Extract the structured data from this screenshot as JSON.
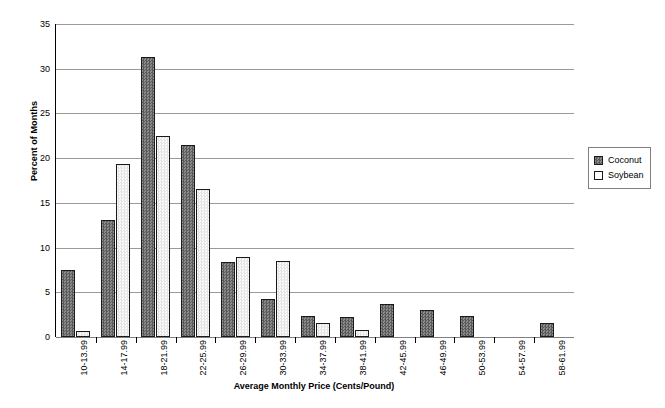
{
  "chart_data": {
    "type": "bar",
    "title": "",
    "xlabel": "Average Monthly Price (Cents/Pound)",
    "ylabel": "Percent of Months",
    "ylim": [
      0,
      35
    ],
    "yticks": [
      0,
      5,
      10,
      15,
      20,
      25,
      30,
      35
    ],
    "grid": true,
    "legend_position": "right",
    "categories": [
      "10-13.99",
      "14-17.99",
      "18-21.99",
      "22-25.99",
      "26-29.99",
      "30-33.99",
      "34-37.99",
      "38-41.99",
      "42-45.99",
      "46-49.99",
      "50-53.99",
      "54-57.99",
      "58-61.99"
    ],
    "series": [
      {
        "name": "Coconut",
        "color": "#6e6e6e",
        "values": [
          7.5,
          13.1,
          31.3,
          21.5,
          8.4,
          4.3,
          2.3,
          2.2,
          3.7,
          3.0,
          2.4,
          0,
          1.6
        ]
      },
      {
        "name": "Soybean",
        "color": "#eeeeee",
        "values": [
          0.7,
          19.4,
          22.5,
          16.6,
          9.0,
          8.5,
          1.6,
          0.8,
          0,
          0,
          0,
          0,
          0
        ]
      }
    ]
  },
  "legend": {
    "entries": [
      {
        "label": "Coconut"
      },
      {
        "label": "Soybean"
      }
    ]
  }
}
